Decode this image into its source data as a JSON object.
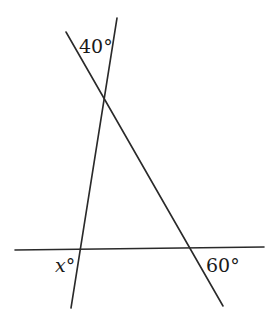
{
  "diagram": {
    "type": "geometry-angles",
    "labels": {
      "top_angle": "40°",
      "bottom_left_var": "x",
      "bottom_left_deg": "°",
      "bottom_right_angle": "60°"
    },
    "lines": [
      {
        "name": "horizontal-line",
        "x1": 15,
        "y1": 250,
        "x2": 264,
        "y2": 247
      },
      {
        "name": "steep-line",
        "x1": 117,
        "y1": 18,
        "x2": 71,
        "y2": 308
      },
      {
        "name": "diagonal-line",
        "x1": 66,
        "y1": 32,
        "x2": 223,
        "y2": 306
      }
    ],
    "stroke_color": "#2a2a2a",
    "background": "#ffffff"
  }
}
